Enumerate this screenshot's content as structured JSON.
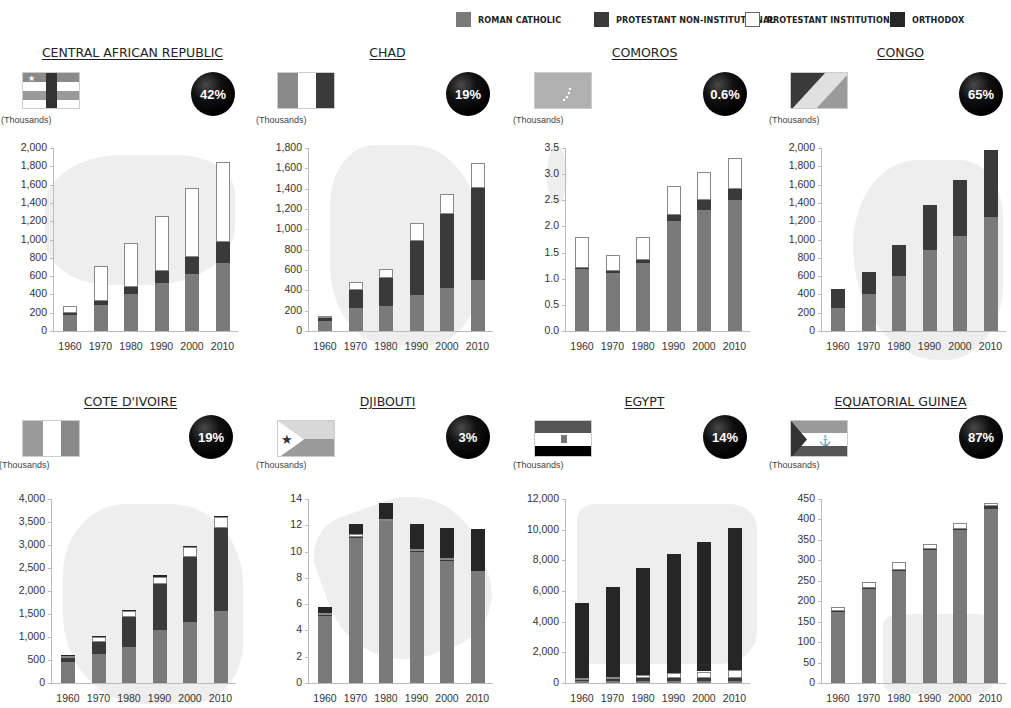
{
  "legend": [
    {
      "label": "ROMAN CATHOLIC",
      "color": "#7a7a7a",
      "x": 456
    },
    {
      "label": "PROTESTANT NON-INSTITUTIONAL",
      "color": "#3a3a3a",
      "x": 594
    },
    {
      "label": "PROTESTANT INSTITUTIONAL",
      "color": "#ffffff",
      "x": 745
    },
    {
      "label": "ORTHODOX",
      "color": "#262626",
      "x": 890
    }
  ],
  "colors": {
    "rc": "#7a7a7a",
    "pni": "#3a3a3a",
    "pi": "#ffffff",
    "orth": "#262626"
  },
  "units_label": "(Thousands)",
  "chart_data": [
    {
      "type": "bar",
      "stacked": true,
      "title": "CENTRAL AFRICAN REPUBLIC",
      "percent": "42%",
      "ylabel": "(Thousands)",
      "categories": [
        "1960",
        "1970",
        "1980",
        "1990",
        "2000",
        "2010"
      ],
      "yticks": [
        "0",
        "200",
        "400",
        "600",
        "800",
        "1,000",
        "1,200",
        "1,400",
        "1,600",
        "1,800",
        "2,000"
      ],
      "ylim": [
        0,
        2000
      ],
      "series": [
        {
          "name": "Roman Catholic",
          "values": [
            180,
            280,
            400,
            520,
            620,
            740
          ]
        },
        {
          "name": "Protestant Non-Institutional",
          "values": [
            20,
            50,
            80,
            140,
            190,
            230
          ]
        },
        {
          "name": "Protestant Institutional",
          "values": [
            70,
            380,
            480,
            600,
            750,
            880
          ]
        },
        {
          "name": "Orthodox",
          "values": [
            0,
            0,
            0,
            0,
            0,
            0
          ]
        }
      ]
    },
    {
      "type": "bar",
      "stacked": true,
      "title": "CHAD",
      "percent": "19%",
      "ylabel": "(Thousands)",
      "categories": [
        "1960",
        "1970",
        "1980",
        "1990",
        "2000",
        "2010"
      ],
      "yticks": [
        "0",
        "200",
        "400",
        "600",
        "800",
        "1,000",
        "1,200",
        "1,400",
        "1,600",
        "1,800"
      ],
      "ylim": [
        0,
        1800
      ],
      "series": [
        {
          "name": "Roman Catholic",
          "values": [
            100,
            230,
            250,
            350,
            420,
            500
          ]
        },
        {
          "name": "Protestant Non-Institutional",
          "values": [
            30,
            170,
            270,
            540,
            730,
            910
          ]
        },
        {
          "name": "Protestant Institutional",
          "values": [
            20,
            80,
            90,
            170,
            200,
            240
          ]
        },
        {
          "name": "Orthodox",
          "values": [
            0,
            0,
            0,
            0,
            0,
            0
          ]
        }
      ]
    },
    {
      "type": "bar",
      "stacked": true,
      "title": "COMOROS",
      "percent": "0.6%",
      "ylabel": "(Thousands)",
      "categories": [
        "1960",
        "1970",
        "1980",
        "1990",
        "2000",
        "2010"
      ],
      "yticks": [
        "0.0",
        "0.5",
        "1.0",
        "1.5",
        "2.0",
        "2.5",
        "3.0",
        "3.5"
      ],
      "ylim": [
        0,
        3.5
      ],
      "series": [
        {
          "name": "Roman Catholic",
          "values": [
            1.2,
            1.1,
            1.3,
            2.1,
            2.32,
            2.5
          ]
        },
        {
          "name": "Protestant Non-Institutional",
          "values": [
            0.01,
            0.05,
            0.05,
            0.12,
            0.18,
            0.22
          ]
        },
        {
          "name": "Protestant Institutional",
          "values": [
            0.59,
            0.3,
            0.45,
            0.56,
            0.55,
            0.58
          ]
        },
        {
          "name": "Orthodox",
          "values": [
            0,
            0,
            0,
            0,
            0,
            0
          ]
        }
      ]
    },
    {
      "type": "bar",
      "stacked": true,
      "title": "CONGO",
      "percent": "65%",
      "ylabel": "(Thousands)",
      "categories": [
        "1960",
        "1970",
        "1980",
        "1990",
        "2000",
        "2010"
      ],
      "yticks": [
        "0",
        "200",
        "400",
        "600",
        "800",
        "1,000",
        "1,200",
        "1,400",
        "1,600",
        "1,800",
        "2,000"
      ],
      "ylim": [
        0,
        2000
      ],
      "series": [
        {
          "name": "Roman Catholic",
          "values": [
            250,
            400,
            600,
            890,
            1040,
            1250
          ]
        },
        {
          "name": "Protestant Non-Institutional",
          "values": [
            210,
            240,
            340,
            490,
            610,
            730
          ]
        },
        {
          "name": "Protestant Institutional",
          "values": [
            0,
            0,
            0,
            0,
            0,
            0
          ]
        },
        {
          "name": "Orthodox",
          "values": [
            0,
            0,
            0,
            0,
            0,
            0
          ]
        }
      ]
    },
    {
      "type": "bar",
      "stacked": true,
      "title": "COTE D'IVOIRE",
      "percent": "19%",
      "ylabel": "(Thousands)",
      "categories": [
        "1960",
        "1970",
        "1980",
        "1990",
        "2000",
        "2010"
      ],
      "yticks": [
        "0",
        "500",
        "1,000",
        "1,500",
        "2,000",
        "2,500",
        "3,000",
        "3,500",
        "4,000"
      ],
      "ylim": [
        0,
        4000
      ],
      "series": [
        {
          "name": "Roman Catholic",
          "values": [
            450,
            640,
            780,
            1150,
            1320,
            1570
          ]
        },
        {
          "name": "Protestant Non-Institutional",
          "values": [
            90,
            260,
            660,
            1010,
            1410,
            1800
          ]
        },
        {
          "name": "Protestant Institutional",
          "values": [
            50,
            110,
            130,
            150,
            220,
            240
          ]
        },
        {
          "name": "Orthodox",
          "values": [
            10,
            20,
            20,
            30,
            30,
            20
          ]
        }
      ]
    },
    {
      "type": "bar",
      "stacked": true,
      "title": "DJIBOUTI",
      "percent": "3%",
      "ylabel": "(Thousands)",
      "categories": [
        "1960",
        "1970",
        "1980",
        "1990",
        "2000",
        "2010"
      ],
      "yticks": [
        "0",
        "2",
        "4",
        "6",
        "8",
        "10",
        "12",
        "14"
      ],
      "ylim": [
        0,
        14
      ],
      "series": [
        {
          "name": "Roman Catholic",
          "values": [
            5.1,
            11.0,
            12.3,
            10.0,
            9.3,
            8.5
          ]
        },
        {
          "name": "Protestant Non-Institutional",
          "values": [
            0.1,
            0.1,
            0.1,
            0.1,
            0.1,
            0.0
          ]
        },
        {
          "name": "Protestant Institutional",
          "values": [
            0.1,
            0.2,
            0.1,
            0.1,
            0.1,
            0.0
          ]
        },
        {
          "name": "Orthodox",
          "values": [
            0.5,
            0.8,
            1.2,
            1.9,
            2.3,
            3.2
          ]
        }
      ]
    },
    {
      "type": "bar",
      "stacked": true,
      "title": "EGYPT",
      "percent": "14%",
      "ylabel": "(Thousands)",
      "categories": [
        "1960",
        "1970",
        "1980",
        "1990",
        "2000",
        "2010"
      ],
      "yticks": [
        "0",
        "2,000",
        "4,000",
        "6,000",
        "8,000",
        "10,000",
        "12,000"
      ],
      "ylim": [
        0,
        12000
      ],
      "series": [
        {
          "name": "Roman Catholic",
          "values": [
            150,
            150,
            150,
            150,
            150,
            150
          ]
        },
        {
          "name": "Protestant Non-Institutional",
          "values": [
            100,
            130,
            150,
            150,
            180,
            180
          ]
        },
        {
          "name": "Protestant Institutional",
          "values": [
            80,
            120,
            250,
            320,
            420,
            520
          ]
        },
        {
          "name": "Orthodox",
          "values": [
            4920,
            5850,
            6950,
            7780,
            8450,
            9250
          ]
        }
      ]
    },
    {
      "type": "bar",
      "stacked": true,
      "title": "EQUATORIAL GUINEA",
      "percent": "87%",
      "ylabel": "(Thousands)",
      "categories": [
        "1960",
        "1970",
        "1980",
        "1990",
        "2000",
        "2010"
      ],
      "yticks": [
        "0",
        "50",
        "100",
        "150",
        "200",
        "250",
        "300",
        "350",
        "400",
        "450"
      ],
      "ylim": [
        0,
        450
      ],
      "series": [
        {
          "name": "Roman Catholic",
          "values": [
            175,
            230,
            275,
            325,
            375,
            425
          ]
        },
        {
          "name": "Protestant Non-Institutional",
          "values": [
            2,
            3,
            2,
            3,
            2,
            7
          ]
        },
        {
          "name": "Protestant Institutional",
          "values": [
            8,
            14,
            20,
            13,
            14,
            7
          ]
        },
        {
          "name": "Orthodox",
          "values": [
            0,
            0,
            0,
            0,
            0,
            0
          ]
        }
      ]
    }
  ]
}
